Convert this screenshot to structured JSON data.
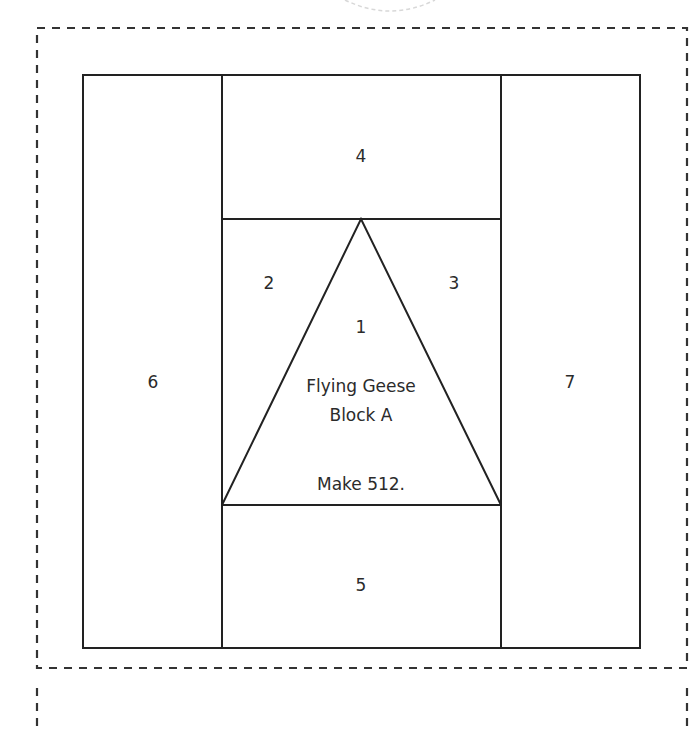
{
  "diagram": {
    "type": "foundation paper piecing pattern",
    "colors": {
      "line": "#222222",
      "dash": "#333333",
      "background": "#ffffff",
      "faint_arc": "#d8d8d8"
    },
    "pieces": [
      {
        "id": "1",
        "label": "1"
      },
      {
        "id": "2",
        "label": "2"
      },
      {
        "id": "3",
        "label": "3"
      },
      {
        "id": "4",
        "label": "4"
      },
      {
        "id": "5",
        "label": "5"
      },
      {
        "id": "6",
        "label": "6"
      },
      {
        "id": "7",
        "label": "7"
      }
    ],
    "block_name_line1": "Flying Geese",
    "block_name_line2": "Block A",
    "instruction": "Make 512."
  }
}
